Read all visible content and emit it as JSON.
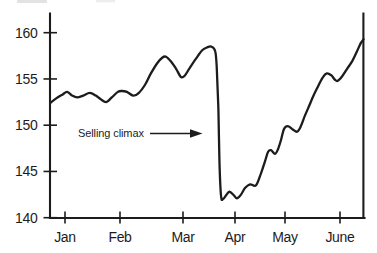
{
  "colors": {
    "ink": "#1c1c1c",
    "background": "#ffffff"
  },
  "chart_data": {
    "type": "line",
    "title": "",
    "xlabel": "",
    "ylabel": "",
    "grid": false,
    "x_axis": {
      "tick_labels": [
        "Jan",
        "Feb",
        "Mar",
        "Apr",
        "May",
        "June"
      ]
    },
    "y_axis": {
      "ticks": [
        160,
        155,
        150,
        145,
        140
      ],
      "range": [
        140,
        162
      ]
    },
    "annotations": [
      {
        "text": "Selling climax",
        "points_to_month": 3.7,
        "at_price": 149.1
      }
    ],
    "series": [
      {
        "name": "price",
        "points": [
          [
            0.73,
            152.4
          ],
          [
            0.84,
            152.9
          ],
          [
            0.95,
            153.3
          ],
          [
            1.04,
            153.6
          ],
          [
            1.13,
            153.2
          ],
          [
            1.22,
            153.0
          ],
          [
            1.33,
            153.2
          ],
          [
            1.45,
            153.5
          ],
          [
            1.56,
            153.2
          ],
          [
            1.65,
            152.8
          ],
          [
            1.75,
            152.5
          ],
          [
            1.85,
            153.0
          ],
          [
            1.96,
            153.6
          ],
          [
            2.03,
            153.7
          ],
          [
            2.11,
            153.6
          ],
          [
            2.21,
            153.2
          ],
          [
            2.3,
            153.5
          ],
          [
            2.4,
            154.4
          ],
          [
            2.49,
            155.6
          ],
          [
            2.59,
            156.7
          ],
          [
            2.67,
            157.3
          ],
          [
            2.73,
            157.4
          ],
          [
            2.81,
            156.9
          ],
          [
            2.89,
            156.1
          ],
          [
            2.97,
            155.2
          ],
          [
            3.04,
            155.4
          ],
          [
            3.13,
            156.2
          ],
          [
            3.25,
            157.2
          ],
          [
            3.37,
            158.1
          ],
          [
            3.46,
            158.4
          ],
          [
            3.54,
            158.5
          ],
          [
            3.62,
            158.0
          ],
          [
            3.65,
            156.1
          ],
          [
            3.68,
            151.7
          ],
          [
            3.7,
            146.3
          ],
          [
            3.73,
            142.4
          ],
          [
            3.77,
            142.0
          ],
          [
            3.85,
            142.6
          ],
          [
            3.9,
            142.8
          ],
          [
            3.98,
            142.4
          ],
          [
            4.04,
            142.1
          ],
          [
            4.12,
            142.5
          ],
          [
            4.2,
            143.2
          ],
          [
            4.3,
            143.6
          ],
          [
            4.42,
            143.5
          ],
          [
            4.52,
            144.8
          ],
          [
            4.6,
            146.1
          ],
          [
            4.66,
            147.1
          ],
          [
            4.72,
            147.3
          ],
          [
            4.8,
            146.9
          ],
          [
            4.86,
            147.4
          ],
          [
            4.92,
            148.4
          ],
          [
            4.98,
            149.6
          ],
          [
            5.05,
            149.9
          ],
          [
            5.13,
            149.6
          ],
          [
            5.22,
            149.3
          ],
          [
            5.29,
            149.9
          ],
          [
            5.36,
            151.0
          ],
          [
            5.44,
            152.1
          ],
          [
            5.51,
            153.1
          ],
          [
            5.6,
            154.2
          ],
          [
            5.69,
            155.2
          ],
          [
            5.76,
            155.6
          ],
          [
            5.84,
            155.4
          ],
          [
            5.91,
            154.9
          ],
          [
            5.96,
            154.8
          ],
          [
            6.04,
            155.3
          ],
          [
            6.13,
            156.1
          ],
          [
            6.22,
            156.9
          ],
          [
            6.31,
            158.0
          ],
          [
            6.38,
            158.9
          ],
          [
            6.43,
            159.3
          ]
        ]
      }
    ]
  }
}
